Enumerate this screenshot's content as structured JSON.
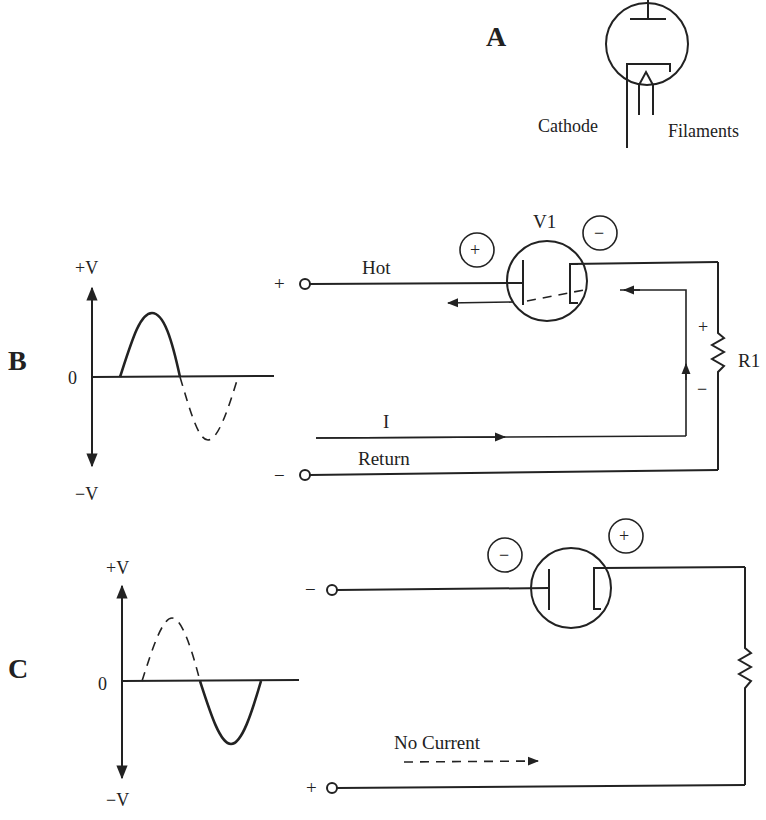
{
  "panels": {
    "a": {
      "label": "A",
      "tube": {
        "cathode_label": "Cathode",
        "filaments_label": "Filaments"
      }
    },
    "b": {
      "label": "B",
      "waveform": {
        "pos_label": "+V",
        "neg_label": "−V",
        "zero_label": "0",
        "solid_half": "positive",
        "dashed_half": "negative"
      },
      "circuit": {
        "tube_label": "V1",
        "plate_charge": "+",
        "cathode_charge": "−",
        "top_terminal_sign": "+",
        "bottom_terminal_sign": "−",
        "hot_label": "Hot",
        "return_label": "Return",
        "current_label": "I",
        "resistor_label": "R1",
        "resistor_plus": "+",
        "resistor_minus": "−"
      }
    },
    "c": {
      "label": "C",
      "waveform": {
        "pos_label": "+V",
        "neg_label": "−V",
        "zero_label": "0",
        "solid_half": "negative",
        "dashed_half": "positive"
      },
      "circuit": {
        "plate_charge": "−",
        "cathode_charge": "+",
        "top_terminal_sign": "−",
        "bottom_terminal_sign": "+",
        "no_current_label": "No Current"
      }
    }
  }
}
